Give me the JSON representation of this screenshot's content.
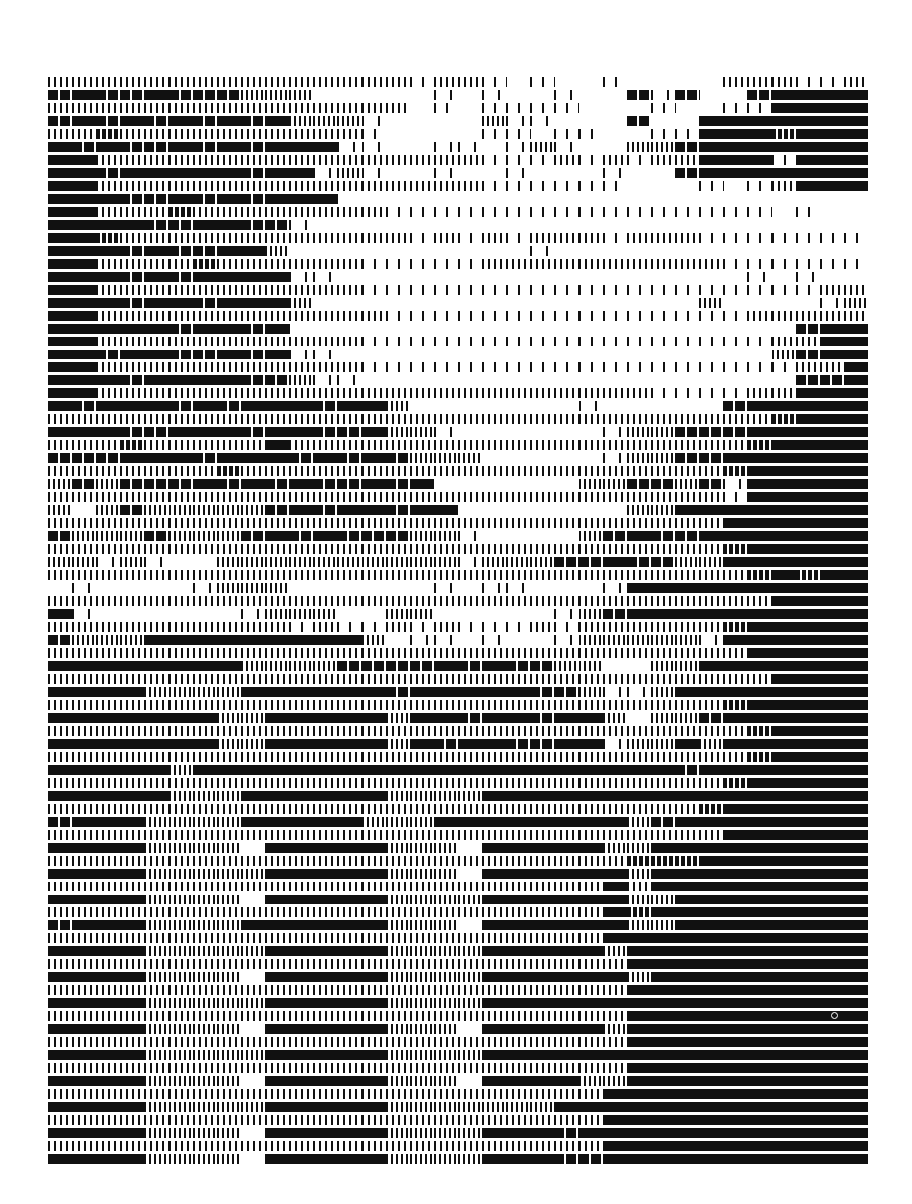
{
  "image": {
    "description": "Typewriter / barcode-style halftone art of a landscape with a tree on the right, rendered in alternating rows of vertical bars and solid blocks",
    "colors": {
      "ink": "#111111",
      "paper": "#ffffff"
    },
    "grid": {
      "rows": 84,
      "cols": 34,
      "row_height": 13,
      "cell_width": 24.12
    },
    "tone_rows": [
      "2222222222222221221010010000222112",
      "3433433322200000101001003130034444",
      "2222222222222220101111000100114444",
      "3434343434222100002110003004444444",
      "2232222222222100001101100114443444",
      "4343343434441100110121002234444444",
      "4422222222222222221112121224441444",
      "4434444434412100100100010034444444",
      "4422222222222222221111110001012444",
      "4443343434440000000000000000000000",
      "4422232222222211111111111111110100",
      "4444334433100000000000000000000000",
      "4432222222222221212122212221111111",
      "4443433442000000000010000000000000",
      "4422223222222111112222222222111111",
      "4443434444110000000000000000010100",
      "4422222222222111111111111111111122",
      "4443443444200000000000000002000012",
      "4422222222222211111111111111122222",
      "4444434434000000000000000000000344",
      "4422222222222111111111111111112244",
      "4434433434110000000000000000002344",
      "4422222222222111111111111111111224",
      "4443444433211000000000000000000334",
      "4422222222222222222222222111122444",
      "4344434344434420000000100000344444",
      "2222222222222222222222222222223444",
      "4443344434433422100000012233344444",
      "2223222224222222222222222222234444",
      "3334443444343432220000012233444444",
      "2222222322222222222222222222344444",
      "2323334343433434000000223323144444",
      "2222222222222222222222222222144444",
      "2023222223434434400000002244444444",
      "2222222222222222222222222222444444",
      "3222322234343332210000234334444444",
      "2222222222222222222222222222344444",
      "2212100222222222212223343322444444",
      "2222222222222222222222222222234344",
      "0100001222000000101100014444444444",
      "2222222222222222222222222222224444",
      "4100000012220022000001234444444444",
      "2222222222121121211121222222344444",
      "3222444444444201101001222221444444",
      "2222222222222222222222222222244444",
      "4444444422223333434332200224444444",
      "2222222222222222222222222222224444",
      "4444222244444434444433211244444444",
      "2222222222222222222222222222344444",
      "4444444224444424434434420223444444",
      "2222222222222222222222222222234444",
      "4444444224444424344334412242444444",
      "2222222222222222222222222222234444",
      "4444424444444444444444444434444444",
      "2222222222222222222222222222344444",
      "4444422244444422224444444444444444",
      "2222222222222222222222222223444444",
      "3444222244444222444444442344444444",
      "2222222222222222222222222222444444",
      "4444222204444422204444422444444444",
      "2222222222222222222222223334444444",
      "4444222224444422204444442444444444",
      "2222222222222222222222242444444444",
      "4444222204444422224444442244444444",
      "2222222222222222222222243444444444",
      "3444222244444422204444442244444444",
      "2222222222222222222222244444444444",
      "4444222224444422224444424444444444",
      "2222222222222222222222224444444444",
      "4444222204444422224444442444444444",
      "2222222222222222222222224444444444",
      "4444222224444422224444444444444444",
      "2222222222222222222222224444444444",
      "4444222204444422204444424444444444",
      "2222222222222222222222224444444444",
      "4444222224444422224444444444444444",
      "2222222222222222222222224444444444",
      "4444222204444422204444224444444444",
      "2222222222222222222222244444444444",
      "4444222224444422222224444444444444",
      "2222222222222222222222244444444444",
      "4444222204444422224443444444444444",
      "2222222222222222222222244444444444",
      "4444222204444422224443344444444444"
    ]
  }
}
